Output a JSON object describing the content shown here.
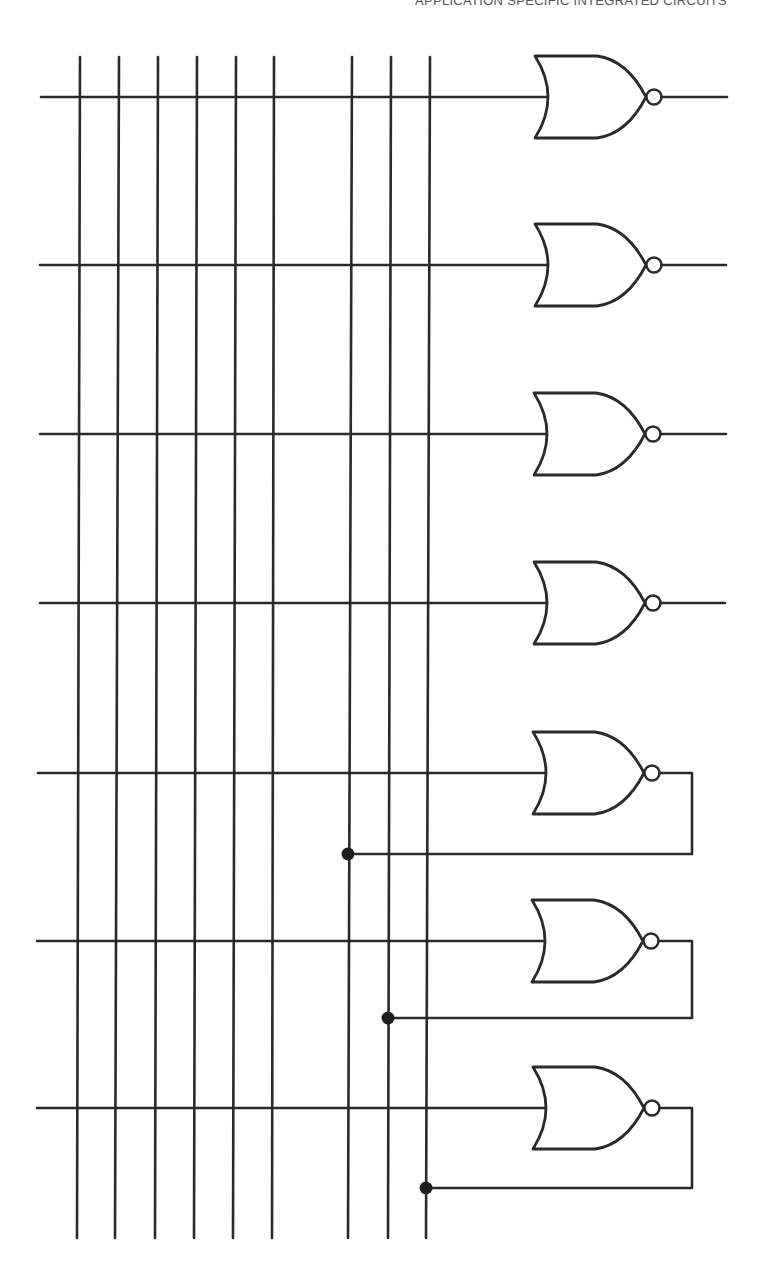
{
  "header": {
    "running_title": "APPLICATION SPECIFIC INTEGRATED CIRCUITS"
  },
  "diagram": {
    "type": "logic-array",
    "colors": {
      "ink": "#2a2a2a",
      "background": "#ffffff"
    },
    "vertical_lines": [
      {
        "x_top": 80,
        "x_bottom": 77
      },
      {
        "x_top": 119,
        "x_bottom": 115
      },
      {
        "x_top": 158,
        "x_bottom": 155
      },
      {
        "x_top": 197,
        "x_bottom": 194
      },
      {
        "x_top": 236,
        "x_bottom": 233
      },
      {
        "x_top": 274,
        "x_bottom": 272
      },
      {
        "x_top": 352,
        "x_bottom": 348
      },
      {
        "x_top": 391,
        "x_bottom": 388
      },
      {
        "x_top": 430,
        "x_bottom": 426
      }
    ],
    "vertical_y_range": [
      57,
      1238
    ],
    "gates": [
      {
        "id": 1,
        "type": "NOR",
        "y": 97,
        "x_start": 41,
        "gate_x": 535,
        "output": "external",
        "out_end": 727
      },
      {
        "id": 2,
        "type": "NOR",
        "y": 265,
        "x_start": 40,
        "gate_x": 535,
        "output": "external",
        "out_end": 726
      },
      {
        "id": 3,
        "type": "NOR",
        "y": 434,
        "x_start": 40,
        "gate_x": 534,
        "output": "external",
        "out_end": 726
      },
      {
        "id": 4,
        "type": "NOR",
        "y": 603,
        "x_start": 40,
        "gate_x": 534,
        "output": "external",
        "out_end": 725
      },
      {
        "id": 5,
        "type": "NOR",
        "y": 773,
        "x_start": 38,
        "gate_x": 533,
        "output": "feedback",
        "loop_x": 692,
        "loop_y": 854,
        "dot_x": 348
      },
      {
        "id": 6,
        "type": "NOR",
        "y": 941,
        "x_start": 37,
        "gate_x": 532,
        "output": "feedback",
        "loop_x": 692,
        "loop_y": 1018,
        "dot_x": 388
      },
      {
        "id": 7,
        "type": "NOR",
        "y": 1108,
        "x_start": 37,
        "gate_x": 533,
        "output": "feedback",
        "loop_x": 692,
        "loop_y": 1188,
        "dot_x": 426
      }
    ]
  }
}
